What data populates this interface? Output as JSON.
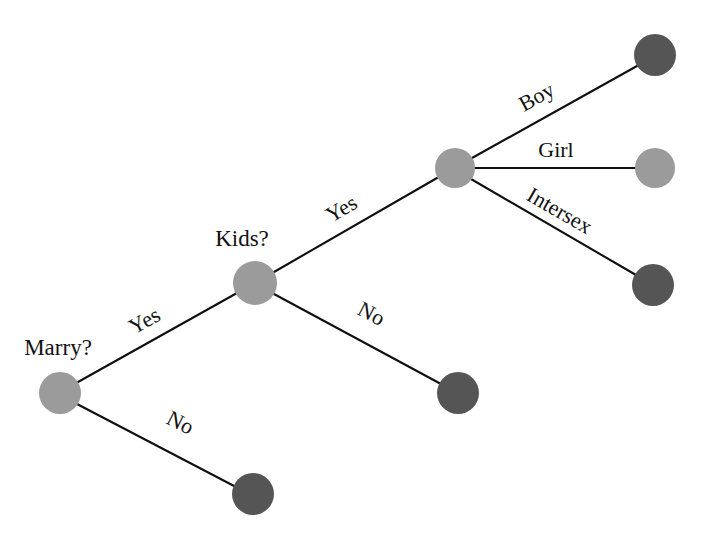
{
  "diagram": {
    "type": "decision-tree",
    "background_color": "#ffffff",
    "edge_color": "#101010",
    "edge_width": 2.1,
    "colors": {
      "decision_node": "#9b9b9b",
      "terminal_dark": "#555555",
      "terminal_light": "#9b9b9b"
    },
    "nodes": [
      {
        "id": "marry",
        "label": "Marry?",
        "kind": "decision",
        "color": "#9b9b9b",
        "cx": 60,
        "cy": 393,
        "r": 21,
        "label_x": 58,
        "label_y": 355,
        "label_anchor": "middle"
      },
      {
        "id": "kids",
        "label": "Kids?",
        "kind": "decision",
        "color": "#9b9b9b",
        "cx": 255,
        "cy": 283,
        "r": 22,
        "label_x": 242,
        "label_y": 246,
        "label_anchor": "middle"
      },
      {
        "id": "sex",
        "label": "",
        "kind": "decision",
        "color": "#9b9b9b",
        "cx": 455,
        "cy": 168,
        "r": 20,
        "label_x": 0,
        "label_y": 0,
        "label_anchor": "middle"
      },
      {
        "id": "no-marry",
        "label": "",
        "kind": "terminal",
        "color": "#555555",
        "cx": 253,
        "cy": 494,
        "r": 21,
        "label_x": 0,
        "label_y": 0,
        "label_anchor": "middle"
      },
      {
        "id": "no-kids",
        "label": "",
        "kind": "terminal",
        "color": "#555555",
        "cx": 458,
        "cy": 393,
        "r": 21,
        "label_x": 0,
        "label_y": 0,
        "label_anchor": "middle"
      },
      {
        "id": "boy",
        "label": "",
        "kind": "terminal",
        "color": "#555555",
        "cx": 655,
        "cy": 55,
        "r": 21,
        "label_x": 0,
        "label_y": 0,
        "label_anchor": "middle"
      },
      {
        "id": "girl",
        "label": "",
        "kind": "terminal",
        "color": "#9b9b9b",
        "cx": 655,
        "cy": 168,
        "r": 20,
        "label_x": 0,
        "label_y": 0,
        "label_anchor": "middle"
      },
      {
        "id": "intersex",
        "label": "",
        "kind": "terminal",
        "color": "#555555",
        "cx": 653,
        "cy": 285,
        "r": 21,
        "label_x": 0,
        "label_y": 0,
        "label_anchor": "middle"
      }
    ],
    "edges": [
      {
        "id": "marry-yes",
        "from": "marry",
        "to": "kids",
        "label": "Yes",
        "x1": 78,
        "y1": 382,
        "x2": 237,
        "y2": 293,
        "label_x": 148,
        "label_y": 327,
        "label_rotation": -29
      },
      {
        "id": "marry-no",
        "from": "marry",
        "to": "no-marry",
        "label": "No",
        "x1": 77,
        "y1": 404,
        "x2": 236,
        "y2": 487,
        "label_x": 177,
        "label_y": 429,
        "label_rotation": 27
      },
      {
        "id": "kids-yes",
        "from": "kids",
        "to": "sex",
        "label": "Yes",
        "x1": 274,
        "y1": 272,
        "x2": 437,
        "y2": 178,
        "label_x": 345,
        "label_y": 215,
        "label_rotation": -30
      },
      {
        "id": "kids-no",
        "from": "kids",
        "to": "no-kids",
        "label": "No",
        "x1": 274,
        "y1": 294,
        "x2": 441,
        "y2": 384,
        "label_x": 368,
        "label_y": 320,
        "label_rotation": 28
      },
      {
        "id": "sex-boy",
        "from": "sex",
        "to": "boy",
        "label": "Boy",
        "x1": 472,
        "y1": 158,
        "x2": 637,
        "y2": 66,
        "label_x": 540,
        "label_y": 103,
        "label_rotation": -29
      },
      {
        "id": "sex-girl",
        "from": "sex",
        "to": "girl",
        "label": "Girl",
        "x1": 475,
        "y1": 168,
        "x2": 635,
        "y2": 168,
        "label_x": 556,
        "label_y": 157,
        "label_rotation": 0
      },
      {
        "id": "sex-intersex",
        "from": "sex",
        "to": "intersex",
        "label": "Intersex",
        "x1": 471,
        "y1": 179,
        "x2": 636,
        "y2": 275,
        "label_x": 556,
        "label_y": 217,
        "label_rotation": 30
      }
    ]
  }
}
